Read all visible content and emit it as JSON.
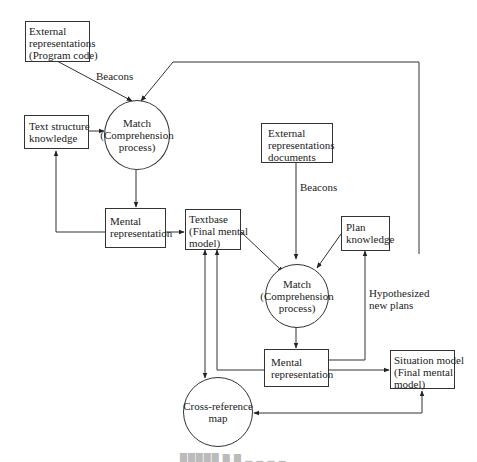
{
  "diagram": {
    "nodes": {
      "ext_program": {
        "lines": [
          "External",
          "representations",
          "(Program code)"
        ]
      },
      "text_structure": {
        "lines": [
          "Text structure",
          "knowledge"
        ]
      },
      "match1": {
        "lines": [
          "Match",
          "(Comprehension",
          "process)"
        ]
      },
      "mental_rep1": {
        "lines": [
          "Mental",
          "representation"
        ]
      },
      "textbase": {
        "lines": [
          "Textbase",
          "(Final mental",
          "model)"
        ]
      },
      "ext_docs": {
        "lines": [
          "External",
          "representations",
          "documents"
        ]
      },
      "plan_knowledge": {
        "lines": [
          "Plan",
          "knowledge"
        ]
      },
      "match2": {
        "lines": [
          "Match",
          "(Comprehension",
          "process)"
        ]
      },
      "mental_rep2": {
        "lines": [
          "Mental",
          "representation"
        ]
      },
      "situation_model": {
        "lines": [
          "Situation model",
          "(Final mental",
          "model)"
        ]
      },
      "cross_ref": {
        "lines": [
          "Cross-reference",
          "map"
        ]
      }
    },
    "edge_labels": {
      "beacons1": "Beacons",
      "beacons2": "Beacons",
      "hypothesized": [
        "Hypothesized",
        "new plans"
      ]
    },
    "edges": [
      {
        "from": "External representations (Program code)",
        "to": "Match (Comprehension process)",
        "label": "Beacons"
      },
      {
        "from": "Text structure knowledge",
        "to": "Match (Comprehension process)"
      },
      {
        "from": "Match (Comprehension process)",
        "to": "Mental representation"
      },
      {
        "from": "Mental representation",
        "to": "Text structure knowledge"
      },
      {
        "from": "Mental representation",
        "to": "Textbase (Final mental model)"
      },
      {
        "from": "Situation model (Final mental model)",
        "to": "Match (Comprehension process)"
      },
      {
        "from": "Textbase (Final mental model)",
        "to": "Match (Comprehension process) 2"
      },
      {
        "from": "External representations documents",
        "to": "Match (Comprehension process) 2",
        "label": "Beacons"
      },
      {
        "from": "Plan knowledge",
        "to": "Match (Comprehension process) 2"
      },
      {
        "from": "Match (Comprehension process) 2",
        "to": "Mental representation 2"
      },
      {
        "from": "Mental representation 2",
        "to": "Plan knowledge",
        "label": "Hypothesized new plans"
      },
      {
        "from": "Mental representation 2",
        "to": "Situation model (Final mental model)"
      },
      {
        "from": "Mental representation 2",
        "to": "Textbase (Final mental model)"
      },
      {
        "from": "Textbase (Final mental model)",
        "to": "Cross-reference map",
        "bidirectional": true
      },
      {
        "from": "Situation model (Final mental model)",
        "to": "Cross-reference map",
        "bidirectional": true
      }
    ]
  }
}
